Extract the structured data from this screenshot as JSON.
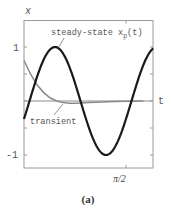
{
  "chart_data": {
    "type": "line",
    "title": "",
    "caption": "(a)",
    "xlabel": "t",
    "ylabel": "x",
    "xlim": [
      0,
      1.99
    ],
    "ylim": [
      -1.2,
      1.2
    ],
    "x_ticks": [
      {
        "value": 1.5708,
        "label": "π/2"
      }
    ],
    "y_ticks": [
      {
        "value": 1,
        "label": "1"
      },
      {
        "value": 0.5,
        "label": ""
      },
      {
        "value": 0,
        "label": ""
      },
      {
        "value": -0.5,
        "label": ""
      },
      {
        "value": -1,
        "label": "-1"
      }
    ],
    "grid": false,
    "legend": "inline annotations",
    "series": [
      {
        "name": "steady-state x_p(t)",
        "label_main": "steady-state x",
        "label_sub": "p",
        "label_tail": "(t)",
        "color": "#1a1a1a",
        "width": 2.2,
        "formula": "cos(4t - 1.91)",
        "x": [
          0,
          0.1,
          0.2,
          0.3,
          0.4,
          0.48,
          0.6,
          0.7,
          0.8,
          0.9,
          1.0,
          1.1,
          1.2,
          1.26,
          1.4,
          1.5,
          1.6,
          1.7,
          1.8,
          1.9,
          1.99
        ],
        "values": [
          -0.33,
          0.06,
          0.44,
          0.76,
          0.96,
          1.0,
          0.87,
          0.59,
          0.23,
          -0.17,
          -0.54,
          -0.84,
          -0.99,
          -1.0,
          -0.82,
          -0.52,
          -0.13,
          0.27,
          0.63,
          0.89,
          0.99
        ]
      },
      {
        "name": "transient",
        "label": "transient",
        "color": "#8a8a8a",
        "width": 1.5,
        "x": [
          0,
          0.1,
          0.2,
          0.3,
          0.4,
          0.5,
          0.6,
          0.7,
          0.8,
          1.0,
          1.2,
          1.4,
          1.6,
          1.84
        ],
        "values": [
          0.75,
          0.5,
          0.3,
          0.16,
          0.06,
          0.0,
          -0.03,
          -0.04,
          -0.04,
          -0.03,
          -0.02,
          -0.01,
          -0.005,
          0.0
        ]
      }
    ]
  }
}
